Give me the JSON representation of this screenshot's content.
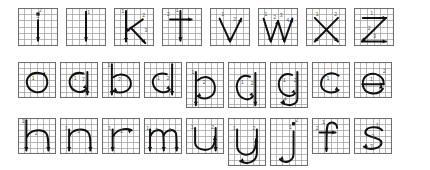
{
  "figure": {
    "type": "handwriting-stroke-order-chart",
    "script": "lowercase-latin-alphabet",
    "background_color": "#ffffff",
    "grid_color": "#9a9a9a",
    "grid_border_color": "#6e6e6e",
    "stroke_color": "#111111",
    "annotation_color": "#555555",
    "grid_columns": 6,
    "grid_rows": 6,
    "total_letters": 26,
    "row_count": 3
  },
  "rows": [
    {
      "index": 1,
      "name": "row-straight-strokes",
      "letters": [
        {
          "char": "i",
          "strokes": 2,
          "descender": false,
          "ascender": true
        },
        {
          "char": "l",
          "strokes": 1,
          "descender": false,
          "ascender": true
        },
        {
          "char": "k",
          "strokes": 3,
          "descender": false,
          "ascender": true
        },
        {
          "char": "t",
          "strokes": 2,
          "descender": false,
          "ascender": true
        },
        {
          "char": "v",
          "strokes": 2,
          "descender": false,
          "ascender": false
        },
        {
          "char": "w",
          "strokes": 4,
          "descender": false,
          "ascender": false
        },
        {
          "char": "x",
          "strokes": 2,
          "descender": false,
          "ascender": false
        },
        {
          "char": "z",
          "strokes": 3,
          "descender": false,
          "ascender": false
        }
      ]
    },
    {
      "index": 2,
      "name": "row-round-strokes",
      "letters": [
        {
          "char": "o",
          "strokes": 1,
          "descender": false,
          "ascender": false
        },
        {
          "char": "a",
          "strokes": 2,
          "descender": false,
          "ascender": false
        },
        {
          "char": "b",
          "strokes": 2,
          "descender": false,
          "ascender": true
        },
        {
          "char": "d",
          "strokes": 2,
          "descender": false,
          "ascender": true
        },
        {
          "char": "p",
          "strokes": 2,
          "descender": true,
          "ascender": false
        },
        {
          "char": "q",
          "strokes": 2,
          "descender": true,
          "ascender": false
        },
        {
          "char": "g",
          "strokes": 2,
          "descender": true,
          "ascender": false
        },
        {
          "char": "c",
          "strokes": 1,
          "descender": false,
          "ascender": false
        },
        {
          "char": "e",
          "strokes": 2,
          "descender": false,
          "ascender": false
        }
      ]
    },
    {
      "index": 3,
      "name": "row-arch-strokes",
      "letters": [
        {
          "char": "h",
          "strokes": 2,
          "descender": false,
          "ascender": true
        },
        {
          "char": "n",
          "strokes": 2,
          "descender": false,
          "ascender": false
        },
        {
          "char": "r",
          "strokes": 2,
          "descender": false,
          "ascender": false
        },
        {
          "char": "m",
          "strokes": 3,
          "descender": false,
          "ascender": false
        },
        {
          "char": "u",
          "strokes": 2,
          "descender": false,
          "ascender": false
        },
        {
          "char": "y",
          "strokes": 2,
          "descender": true,
          "ascender": false
        },
        {
          "char": "j",
          "strokes": 2,
          "descender": true,
          "ascender": false
        },
        {
          "char": "f",
          "strokes": 2,
          "descender": false,
          "ascender": true
        },
        {
          "char": "s",
          "strokes": 1,
          "descender": false,
          "ascender": false
        }
      ]
    }
  ],
  "stroke_numbers": [
    "1",
    "2",
    "3",
    "4"
  ]
}
